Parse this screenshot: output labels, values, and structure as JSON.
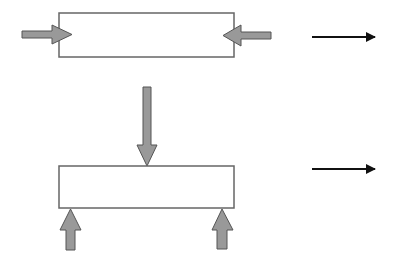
{
  "diagram": {
    "colors": {
      "force_arrow_fill": "#999999",
      "force_arrow_stroke": "#555555",
      "beam_stroke": "#666666",
      "beam_fill": "#ffffff",
      "result_arrow": "#111111",
      "background": "#ffffff"
    },
    "panels": [
      {
        "name": "axial-compression",
        "beam": "rectangle",
        "forces": [
          {
            "name": "left-push",
            "direction": "right"
          },
          {
            "name": "right-push",
            "direction": "left"
          }
        ],
        "result_arrow_direction": "right"
      },
      {
        "name": "transverse-bending",
        "beam": "rectangle",
        "forces": [
          {
            "name": "center-load",
            "direction": "down"
          },
          {
            "name": "left-support",
            "direction": "up"
          },
          {
            "name": "right-support",
            "direction": "up"
          }
        ],
        "result_arrow_direction": "right"
      }
    ]
  }
}
